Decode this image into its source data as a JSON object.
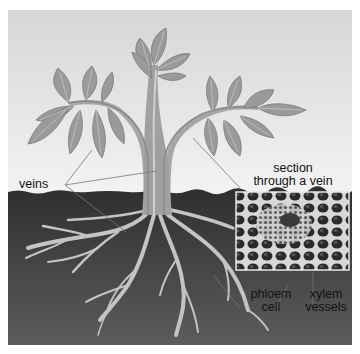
{
  "figure": {
    "labels": {
      "veins": "veins",
      "section_line1": "section",
      "section_line2": "through a vein",
      "phloem_line1": "phloem",
      "phloem_line2": "cell",
      "xylem_line1": "xylem",
      "xylem_line2": "vessels"
    },
    "colors": {
      "sky_top": "#d6d6d6",
      "sky_bottom": "#f3f3f3",
      "soil_top": "#2e2e2e",
      "soil_bottom": "#5a5a5a",
      "leaf": "#9a9a9a",
      "stem": "#a8a8a8",
      "vein": "#cfcfcf",
      "root": "#c8c8c8"
    }
  }
}
